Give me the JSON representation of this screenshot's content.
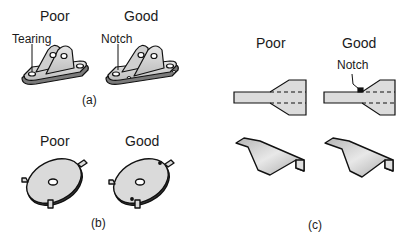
{
  "panels": [
    {
      "id": "a",
      "caption": "(a)",
      "columns": [
        {
          "label": "Poor",
          "callout": "Tearing"
        },
        {
          "label": "Good",
          "callout": "Notch"
        }
      ],
      "subject": "bent bracket with ears"
    },
    {
      "id": "b",
      "caption": "(b)",
      "columns": [
        {
          "label": "Poor"
        },
        {
          "label": "Good"
        }
      ],
      "subject": "disc with bent tabs"
    },
    {
      "id": "c",
      "caption": "(c)",
      "columns": [
        {
          "label": "Poor"
        },
        {
          "label": "Good",
          "callout": "Notch"
        }
      ],
      "subject": "flat blank and formed channel"
    }
  ],
  "colors": {
    "part_fill": "#d9d9d9",
    "part_shadow": "#8a8a8a",
    "outline": "#111111"
  }
}
